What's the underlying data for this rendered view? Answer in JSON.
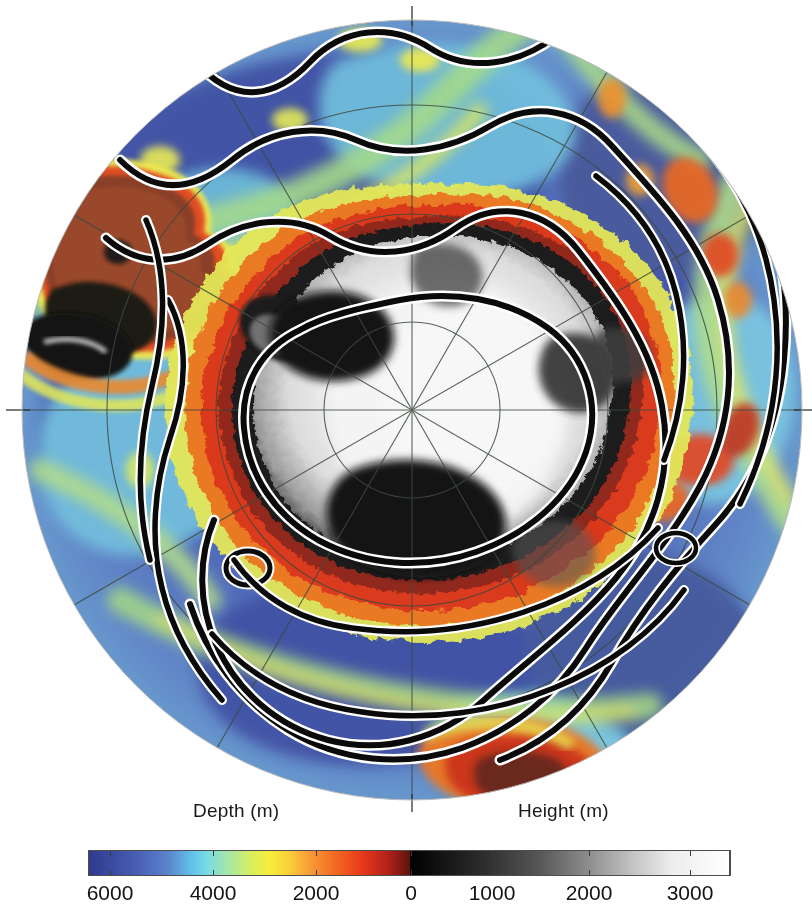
{
  "figure": {
    "kind": "polar-stereographic-map",
    "region": "Antarctica and Southern Ocean",
    "background_color": "#ffffff",
    "width": 812,
    "height": 916
  },
  "map": {
    "projection": "south-polar-stereographic",
    "center_px": [
      412,
      410
    ],
    "radius_px": 390,
    "pole_marker": "south-pole",
    "graticule": {
      "meridian_interval_deg": 30,
      "meridian_count": 12,
      "latitude_circles_px_radii": [
        88,
        196,
        305,
        390
      ],
      "line_color": "#3c4a3c",
      "line_width": 1
    },
    "crosshair": {
      "horizontal_y_px": 410,
      "vertical_x_px": 412,
      "color": "#333333"
    },
    "fronts": {
      "description": "Antarctic Circumpolar Current fronts",
      "style": "black lines with white halo",
      "line_color": "#000000",
      "halo_color": "#ffffff",
      "count": 4
    }
  },
  "colorbar": {
    "depth_label": "Depth (m)",
    "height_label": "Height (m)",
    "units": "m",
    "x_start_px": 89,
    "x_end_px": 729,
    "zero_px": 410,
    "ticks": [
      {
        "label": "6000",
        "x_px": 110,
        "side": "depth",
        "value": 6000
      },
      {
        "label": "4000",
        "x_px": 213,
        "side": "depth",
        "value": 4000
      },
      {
        "label": "2000",
        "x_px": 316,
        "side": "depth",
        "value": 2000
      },
      {
        "label": "0",
        "x_px": 411,
        "side": "zero",
        "value": 0
      },
      {
        "label": "1000",
        "x_px": 492,
        "side": "height",
        "value": 1000
      },
      {
        "label": "2000",
        "x_px": 589,
        "side": "height",
        "value": 2000
      },
      {
        "label": "3000",
        "x_px": 690,
        "side": "height",
        "value": 3000
      }
    ],
    "stops": [
      {
        "pos": 0.0,
        "color": "#2e3b8c"
      },
      {
        "pos": 0.06,
        "color": "#3a4a9e"
      },
      {
        "pos": 0.17,
        "color": "#4a63b8"
      },
      {
        "pos": 0.255,
        "color": "#5b87cf"
      },
      {
        "pos": 0.31,
        "color": "#63c3e8"
      },
      {
        "pos": 0.355,
        "color": "#79dbe2"
      },
      {
        "pos": 0.415,
        "color": "#a9e8a0"
      },
      {
        "pos": 0.465,
        "color": "#d7ef62"
      },
      {
        "pos": 0.51,
        "color": "#f8ef3c"
      },
      {
        "pos": 0.56,
        "color": "#fcd93a"
      },
      {
        "pos": 0.605,
        "color": "#f9a63a"
      },
      {
        "pos": 0.66,
        "color": "#f26722"
      },
      {
        "pos": 0.715,
        "color": "#e8391c"
      },
      {
        "pos": 0.77,
        "color": "#b3241a"
      },
      {
        "pos": 0.795,
        "color": "#7a1a14"
      },
      {
        "pos": 0.5,
        "color": "#000000"
      }
    ],
    "frame_color": "#4d4d4d",
    "tick_color": "#3a3a3a",
    "text_color": "#141414"
  },
  "chart_data": {
    "type": "heatmap",
    "title": "",
    "xlabel": "",
    "ylabel": "",
    "legend_position": "bottom",
    "colorbar_left_label": "Depth (m)",
    "colorbar_right_label": "Height (m)",
    "depth_range_m": [
      6000,
      0
    ],
    "height_range_m": [
      0,
      3000
    ],
    "tick_values_depth": [
      6000,
      4000,
      2000,
      0
    ],
    "tick_values_height": [
      0,
      1000,
      2000,
      3000
    ],
    "tick_labels": [
      "6000",
      "4000",
      "2000",
      "0",
      "1000",
      "2000",
      "3000"
    ],
    "colormap_ocean": [
      "#2e3b8c",
      "#4a63b8",
      "#63c3e8",
      "#a9e8a0",
      "#f8ef3c",
      "#f9a63a",
      "#e8391c",
      "#7a1a14"
    ],
    "colormap_land": [
      "#000000",
      "#4d4d4d",
      "#9a9a9a",
      "#e8e8e8",
      "#ffffff"
    ]
  }
}
